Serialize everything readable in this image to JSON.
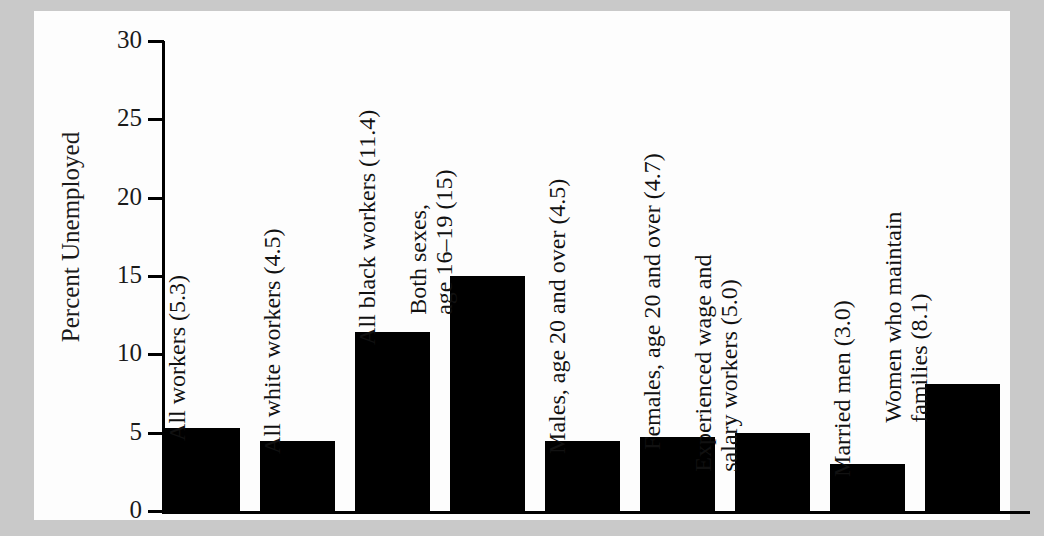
{
  "figure": {
    "background_color": "#c9c9c9",
    "card_color": "#fdfdfd",
    "bar_color": "#000000",
    "axis_color": "#000000"
  },
  "axis": {
    "y_title": "Percent Unemployed",
    "y_ticks": [
      "30",
      "25",
      "20",
      "15",
      "10",
      "5",
      "0"
    ]
  },
  "chart_data": {
    "type": "bar",
    "title": "",
    "xlabel": "",
    "ylabel": "Percent Unemployed",
    "ylim": [
      0,
      30
    ],
    "ytick_values": [
      0,
      5,
      10,
      15,
      20,
      25,
      30
    ],
    "grid": false,
    "legend": null,
    "orientation": "vertical",
    "categories": [
      "All workers",
      "All white workers",
      "All black workers",
      "Both sexes, age 16–19",
      "Males, age 20 and over",
      "Females, age 20 and over",
      "Experienced wage and salary workers",
      "Married men",
      "Women who maintain families"
    ],
    "values": [
      5.3,
      4.5,
      11.4,
      15,
      4.5,
      4.7,
      5.0,
      3.0,
      8.1
    ],
    "data_labels": [
      "All workers (5.3)",
      "All white workers (4.5)",
      "All black workers (11.4)",
      "Both sexes, age 16–19 (15)",
      "Males, age 20 and over (4.5)",
      "Females, age 20 and over (4.7)",
      "Experienced wage and salary workers (5.0)",
      "Married men (3.0)",
      "Women who maintain families (8.1)"
    ]
  },
  "bars": [
    {
      "value": 5.3,
      "label_line1": "All workers (5.3)",
      "label_line2": ""
    },
    {
      "value": 4.5,
      "label_line1": "All white workers (4.5)",
      "label_line2": ""
    },
    {
      "value": 11.4,
      "label_line1": "All black workers (11.4)",
      "label_line2": ""
    },
    {
      "value": 15,
      "label_line1": "Both sexes,",
      "label_line2": "age 16–19 (15)"
    },
    {
      "value": 4.5,
      "label_line1": "Males, age 20 and over (4.5)",
      "label_line2": ""
    },
    {
      "value": 4.7,
      "label_line1": "Females, age 20 and over (4.7)",
      "label_line2": ""
    },
    {
      "value": 5.0,
      "label_line1": "Experienced wage and",
      "label_line2": "salary workers (5.0)"
    },
    {
      "value": 3.0,
      "label_line1": "Married men (3.0)",
      "label_line2": ""
    },
    {
      "value": 8.1,
      "label_line1": "Women who maintain",
      "label_line2": "families (8.1)"
    }
  ]
}
